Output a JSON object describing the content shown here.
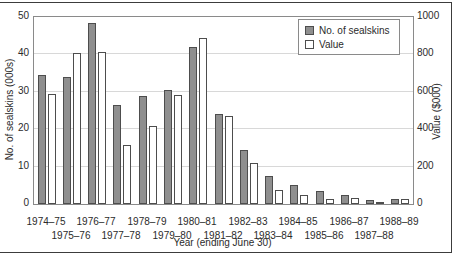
{
  "figure": {
    "background": "#ffffff",
    "frame_color": "#3c3c3c",
    "plot_border_color": "#8a8a8a",
    "gridline_color": "#d8d8d8"
  },
  "chart_data": {
    "type": "bar",
    "title": "",
    "xlabel": "Year (ending June 30)",
    "grid": true,
    "categories": [
      "1974–75",
      "1975–76",
      "1976–77",
      "1977–78",
      "1978–79",
      "1979–80",
      "1980–81",
      "1981–82",
      "1982–83",
      "1983–84",
      "1984–85",
      "1985–86",
      "1986–87",
      "1987–88",
      "1988–89"
    ],
    "series": [
      {
        "name": "No. of sealskins",
        "axis": "left",
        "fill": "#8f8f8f",
        "border": "#4d4d4d",
        "values": [
          34.5,
          34,
          48.5,
          26.5,
          29,
          30.5,
          42,
          24,
          14.5,
          7.5,
          5,
          3.5,
          2.3,
          1,
          1.3
        ]
      },
      {
        "name": "Value",
        "axis": "right",
        "fill": "#ffffff",
        "border": "#4d4d4d",
        "values": [
          590,
          805,
          815,
          315,
          415,
          585,
          890,
          470,
          220,
          75,
          48,
          25,
          30,
          12,
          28
        ]
      }
    ],
    "left_axis": {
      "label": "No. of sealskins (000s)",
      "min": 0,
      "max": 50,
      "ticks": [
        0,
        10,
        20,
        30,
        40,
        50
      ]
    },
    "right_axis": {
      "label": "Value ($000)",
      "min": 0,
      "max": 1000,
      "ticks": [
        0,
        200,
        400,
        600,
        800,
        1000
      ]
    },
    "legend": {
      "position": "top-right",
      "entries": [
        "No. of sealskins",
        "Value"
      ]
    }
  }
}
